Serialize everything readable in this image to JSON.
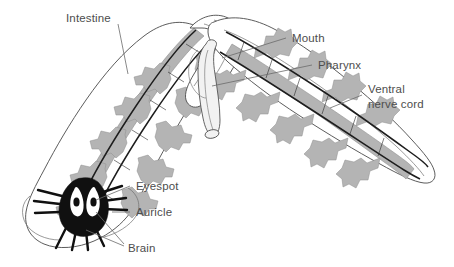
{
  "figure": {
    "background_color": "#ffffff",
    "width": 454,
    "height": 267,
    "label_color": "#4d4d4d",
    "leader_color": "#6b6b6b"
  },
  "labels": {
    "intestine": "Intestine",
    "mouth": "Mouth",
    "pharynx": "Pharynx",
    "ventral_nerve_cord_line1": "Ventral",
    "ventral_nerve_cord_line2": "nerve cord",
    "eyespot": "Eyespot",
    "auricle": "Auricle",
    "brain": "Brain"
  },
  "structures": {
    "intestine": {
      "name": "Intestine",
      "color": "#b4b4b4",
      "description": "Branched gray gut with lateral diverticula"
    },
    "nerve_cord": {
      "name": "Ventral nerve cord",
      "color": "#1d1d1d",
      "description": "Paired dark longitudinal cords with ladder commissures"
    },
    "pharynx": {
      "name": "Pharynx",
      "color": "#f2f2f2",
      "description": "Muscular tube projecting from mid-body"
    },
    "brain": {
      "name": "Brain",
      "color": "#101010",
      "description": "Dark bilobed cerebral ganglia in head"
    },
    "eyespot": {
      "name": "Eyespot",
      "color": "#ffffff",
      "description": "Paired white cup ocelli with dark pigment"
    },
    "auricle": {
      "name": "Auricle",
      "color": "#ffffff",
      "description": "Lateral head lobe flap"
    },
    "mouth": {
      "name": "Mouth",
      "color": "#ffffff",
      "description": "Opening at base of pharynx"
    }
  }
}
